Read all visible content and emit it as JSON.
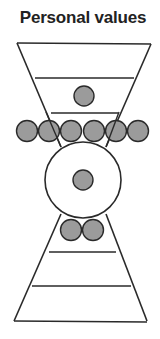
{
  "title": "Personal values",
  "colors": {
    "stroke": "#2a2a2a",
    "dot_fill": "#9b9b9b",
    "background": "#ffffff"
  },
  "diagram": {
    "upper_funnel": {
      "bands": 3,
      "dots_in_band_2": 1
    },
    "middle_row_dots": 6,
    "central_circle": {
      "inner_dots": 1
    },
    "neck_dots": 2,
    "lower_pyramid": {
      "bands": 3
    }
  }
}
